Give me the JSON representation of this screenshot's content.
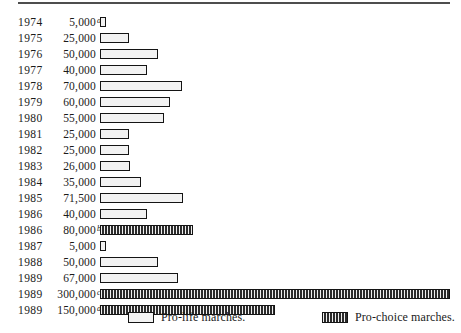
{
  "chart_data": {
    "type": "bar",
    "orientation": "horizontal",
    "title": "",
    "subtitle": "",
    "xlabel": "",
    "ylabel": "",
    "grid": false,
    "xlim": [
      0,
      300000
    ],
    "legend_position": "bottom",
    "categories": [
      "1974",
      "1975",
      "1976",
      "1977",
      "1978",
      "1979",
      "1980",
      "1981",
      "1982",
      "1983",
      "1984",
      "1985",
      "1986",
      "1986",
      "1987",
      "1988",
      "1989",
      "1989",
      "1989"
    ],
    "values": [
      5000,
      25000,
      50000,
      40000,
      70000,
      60000,
      55000,
      25000,
      25000,
      26000,
      35000,
      71500,
      40000,
      80000,
      5000,
      50000,
      67000,
      300000,
      150000
    ],
    "value_labels": [
      "5,000",
      "25,000",
      "50,000",
      "40,000",
      "70,000",
      "60,000",
      "55,000",
      "25,000",
      "25,000",
      "26,000",
      "35,000",
      "71,500",
      "40,000",
      "80,000",
      "5,000",
      "50,000",
      "67,000",
      "300,000",
      "150,000"
    ],
    "footnote_marks": [
      "a",
      "",
      "",
      "",
      "",
      "",
      "",
      "",
      "",
      "",
      "",
      "",
      "",
      "b",
      "",
      "",
      "",
      "c",
      "d"
    ],
    "series_of_bar": [
      "pro-life",
      "pro-life",
      "pro-life",
      "pro-life",
      "pro-life",
      "pro-life",
      "pro-life",
      "pro-life",
      "pro-life",
      "pro-life",
      "pro-life",
      "pro-life",
      "pro-life",
      "pro-choice",
      "pro-life",
      "pro-life",
      "pro-life",
      "pro-choice",
      "pro-choice"
    ],
    "legend": [
      {
        "key": "pro-life",
        "label": "Pro-life marches."
      },
      {
        "key": "pro-choice",
        "label": "Pro-choice marches."
      }
    ]
  },
  "colors": {
    "rule": "#4d4d4d",
    "bar_border": "#141414",
    "prolife_fill": "#f2f2f2",
    "prochoice_fill": "#2b2b2b",
    "text": "#1a1a1a"
  },
  "scale": {
    "px_per_unit": 0.001167,
    "bar_origin_px": 100
  }
}
